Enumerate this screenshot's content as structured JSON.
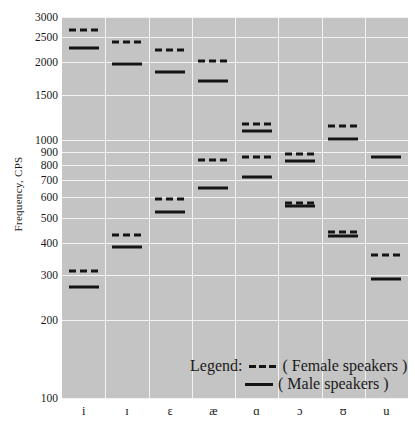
{
  "chart_data": {
    "type": "scatter",
    "title": "",
    "xlabel": "",
    "ylabel": "Frequency, CPS",
    "yscale": "log",
    "ylim": [
      100,
      3000
    ],
    "yticks": [
      100,
      200,
      300,
      400,
      500,
      600,
      700,
      800,
      900,
      1000,
      1500,
      2000,
      2500,
      3000
    ],
    "ytick_labels": [
      "100",
      "200",
      "300",
      "400",
      "500",
      "600",
      "700",
      "800",
      "900",
      "1000",
      "1500",
      "2000",
      "2500",
      "3000"
    ],
    "grid": true,
    "categories": [
      "i",
      "ɪ",
      "ɛ",
      "æ",
      "ɑ",
      "ɔ",
      "ʊ",
      "u"
    ],
    "series": [
      {
        "name": "Female speakers",
        "style": "dashed",
        "color": "#141414",
        "formants": {
          "F2": [
            2680,
            2400,
            2240,
            2020,
            1150,
            880,
            1130,
            360
          ],
          "F1": [
            310,
            430,
            590,
            840,
            860,
            570,
            440,
            360
          ]
        },
        "values_F2": [
          2680,
          2400,
          2240,
          2020,
          1150,
          880,
          1130,
          360
        ],
        "values_F1": [
          310,
          430,
          590,
          840,
          860,
          570,
          440,
          360
        ]
      },
      {
        "name": "Male speakers",
        "style": "solid",
        "color": "#141414",
        "formants": {
          "F2": [
            2280,
            1970,
            1840,
            1700,
            1080,
            830,
            1010,
            860
          ],
          "F1": [
            270,
            385,
            525,
            650,
            720,
            555,
            425,
            290
          ]
        },
        "values_F2": [
          2280,
          1970,
          1840,
          1700,
          1080,
          830,
          1010,
          860
        ],
        "values_F1": [
          270,
          385,
          525,
          650,
          720,
          555,
          425,
          290
        ]
      }
    ],
    "points": [
      {
        "vowel": "i",
        "speaker": "Female speakers",
        "formant": "F2",
        "value": 2680
      },
      {
        "vowel": "i",
        "speaker": "Male speakers",
        "formant": "F2",
        "value": 2280
      },
      {
        "vowel": "i",
        "speaker": "Female speakers",
        "formant": "F1",
        "value": 310
      },
      {
        "vowel": "i",
        "speaker": "Male speakers",
        "formant": "F1",
        "value": 270
      },
      {
        "vowel": "ɪ",
        "speaker": "Female speakers",
        "formant": "F2",
        "value": 2400
      },
      {
        "vowel": "ɪ",
        "speaker": "Male speakers",
        "formant": "F2",
        "value": 1970
      },
      {
        "vowel": "ɪ",
        "speaker": "Female speakers",
        "formant": "F1",
        "value": 430
      },
      {
        "vowel": "ɪ",
        "speaker": "Male speakers",
        "formant": "F1",
        "value": 385
      },
      {
        "vowel": "ɛ",
        "speaker": "Female speakers",
        "formant": "F2",
        "value": 2240
      },
      {
        "vowel": "ɛ",
        "speaker": "Male speakers",
        "formant": "F2",
        "value": 1840
      },
      {
        "vowel": "ɛ",
        "speaker": "Female speakers",
        "formant": "F1",
        "value": 590
      },
      {
        "vowel": "ɛ",
        "speaker": "Male speakers",
        "formant": "F1",
        "value": 525
      },
      {
        "vowel": "æ",
        "speaker": "Female speakers",
        "formant": "F2",
        "value": 2020
      },
      {
        "vowel": "æ",
        "speaker": "Male speakers",
        "formant": "F2",
        "value": 1700
      },
      {
        "vowel": "æ",
        "speaker": "Female speakers",
        "formant": "F1",
        "value": 840
      },
      {
        "vowel": "æ",
        "speaker": "Male speakers",
        "formant": "F1",
        "value": 650
      },
      {
        "vowel": "ɑ",
        "speaker": "Female speakers",
        "formant": "F2",
        "value": 1150
      },
      {
        "vowel": "ɑ",
        "speaker": "Male speakers",
        "formant": "F2",
        "value": 1080
      },
      {
        "vowel": "ɑ",
        "speaker": "Female speakers",
        "formant": "F1",
        "value": 860
      },
      {
        "vowel": "ɑ",
        "speaker": "Male speakers",
        "formant": "F1",
        "value": 720
      },
      {
        "vowel": "ɔ",
        "speaker": "Female speakers",
        "formant": "F2",
        "value": 880
      },
      {
        "vowel": "ɔ",
        "speaker": "Male speakers",
        "formant": "F2",
        "value": 830
      },
      {
        "vowel": "ɔ",
        "speaker": "Female speakers",
        "formant": "F1",
        "value": 570
      },
      {
        "vowel": "ɔ",
        "speaker": "Male speakers",
        "formant": "F1",
        "value": 555
      },
      {
        "vowel": "ʊ",
        "speaker": "Female speakers",
        "formant": "F2",
        "value": 1130
      },
      {
        "vowel": "ʊ",
        "speaker": "Male speakers",
        "formant": "F2",
        "value": 1010
      },
      {
        "vowel": "ʊ",
        "speaker": "Female speakers",
        "formant": "F1",
        "value": 440
      },
      {
        "vowel": "ʊ",
        "speaker": "Male speakers",
        "formant": "F1",
        "value": 425
      },
      {
        "vowel": "u",
        "speaker": "Female speakers",
        "formant": "F2",
        "value": 360
      },
      {
        "vowel": "u",
        "speaker": "Male speakers",
        "formant": "F2",
        "value": 860
      },
      {
        "vowel": "u",
        "speaker": "Male speakers",
        "formant": "F1",
        "value": 290
      }
    ]
  },
  "legend": {
    "title": "Legend:",
    "female_text": "( Female speakers )",
    "male_text": "( Male speakers )"
  },
  "style": {
    "plot_bg": "#c4c4c4",
    "grid_color": "#f2f2f2",
    "marker_color": "#141414",
    "page_bg": "#ffffff"
  }
}
